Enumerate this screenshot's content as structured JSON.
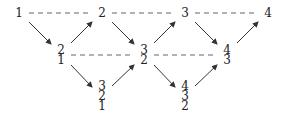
{
  "diagram": {
    "row1": [
      "1",
      "2",
      "3",
      "4"
    ],
    "row2": [
      [
        "2",
        "1"
      ],
      [
        "3",
        "2"
      ],
      [
        "4",
        "3"
      ]
    ],
    "row3": [
      [
        "3",
        "2",
        "1"
      ],
      [
        "4",
        "3",
        "2"
      ]
    ],
    "colors": {
      "text": "#222222",
      "arrow": "#333333",
      "dash": "#666666"
    }
  }
}
